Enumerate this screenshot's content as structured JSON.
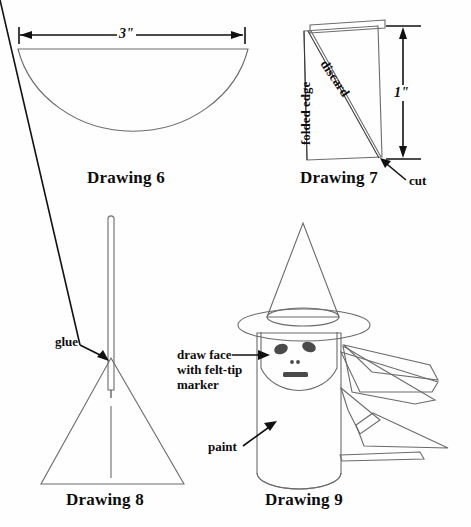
{
  "page": {
    "background_color": "#fefefe",
    "line_color": "#6b6b6b",
    "ink_color": "#111111"
  },
  "figures": [
    {
      "id": "drawing-6",
      "caption": "Drawing 6",
      "shape": "semicircle",
      "dimension_label": "3\"",
      "dimension_orientation": "horizontal",
      "description": "Half circle of paper with 3 inch width dimension arrow above"
    },
    {
      "id": "drawing-7",
      "caption": "Drawing 7",
      "shape": "folded-rectangle",
      "dimension_label": "1\"",
      "dimension_orientation": "vertical",
      "labels": {
        "folded_edge": "folded edge",
        "discard": "discard",
        "cut": "cut"
      },
      "description": "Folded paper rectangle with diagonal cut line, discard region, folded edge on left, 1 inch height"
    },
    {
      "id": "drawing-8",
      "caption": "Drawing 8",
      "shape": "cone-on-stick",
      "labels": {
        "glue": "glue"
      },
      "description": "Paper cone glued onto a thin wooden stick"
    },
    {
      "id": "drawing-9",
      "caption": "Drawing 9",
      "shape": "witch-figure",
      "labels": {
        "draw_face": "draw face\nwith felt-tip\nmarker",
        "draw_face_line1": "draw face",
        "draw_face_line2": "with felt-tip",
        "draw_face_line3": "marker",
        "paint": "paint"
      },
      "description": "Finished witch figure: cylinder body, cone hat with brim, drawn face and wings"
    }
  ]
}
